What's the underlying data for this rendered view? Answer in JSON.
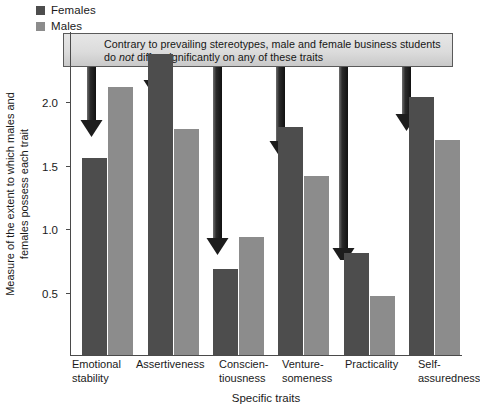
{
  "chart_data": {
    "type": "bar",
    "title": "",
    "xlabel": "Specific traits",
    "ylabel": "Measure of the extent to which males and\nfemales possess each trait",
    "ylabel_line1": "Measure of the extent to which males and",
    "ylabel_line2": "females possess each trait",
    "ylim": [
      0,
      2.15
    ],
    "yticks": [
      0.5,
      1.0,
      1.5,
      2.0
    ],
    "ytick_labels": [
      "0.5",
      "1.0",
      "1.5",
      "2.0"
    ],
    "grid": false,
    "legend_position": "top-left",
    "categories": [
      "Emotional\nstability",
      "Assertiveness",
      "Conscien-\ntiousness",
      "Venture-\nsomeness",
      "Practicality",
      "Self-\nassuredness"
    ],
    "series": [
      {
        "name": "Females",
        "color": "#4d4d4d",
        "values": [
          1.31,
          2.0,
          0.57,
          1.51,
          0.68,
          1.71
        ]
      },
      {
        "name": "Males",
        "color": "#8c8c8c",
        "values": [
          1.78,
          1.5,
          0.78,
          1.19,
          0.39,
          1.43
        ]
      }
    ],
    "annotations": [
      {
        "name": "callout",
        "text_line1": "Contrary to prevailing stereotypes, male and female business students",
        "text_line2_before": "do ",
        "text_line2_italic": "not",
        "text_line2_after": " differ significantly on any of these traits",
        "arrow_count": 6
      }
    ]
  },
  "legend": {
    "items": [
      {
        "label": "Females",
        "color": "#4d4d4d"
      },
      {
        "label": "Males",
        "color": "#8c8c8c"
      }
    ]
  },
  "axes": {
    "y_ticks": [
      {
        "label": "2.0",
        "value": 2.0
      },
      {
        "label": "1.5",
        "value": 1.5
      },
      {
        "label": "1.0",
        "value": 1.0
      },
      {
        "label": "0.5",
        "value": 0.5
      }
    ],
    "y_title_line1": "Measure of the extent to which males and",
    "y_title_line2": "females possess each trait",
    "x_title": "Specific traits"
  },
  "callout": {
    "line1": "Contrary to prevailing stereotypes, male and female business students",
    "line2_a": "do ",
    "line2_em": "not",
    "line2_b": " differ significantly on any of these traits"
  },
  "colors": {
    "females": "#4d4d4d",
    "males": "#8c8c8c",
    "axis": "#4a4a4a",
    "arrow": "#2b2b2b",
    "box_fill": "#dcdcdc",
    "box_border": "#5a5a5a"
  }
}
